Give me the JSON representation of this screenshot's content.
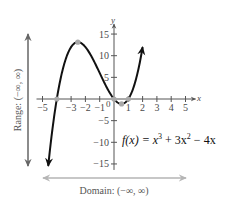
{
  "chart_data": {
    "type": "line",
    "title": "",
    "function_label": "f(x) = x³ + 3x² − 4x",
    "function_parts": {
      "lhs": "f(x) = x",
      "p1": "3",
      "mid": " + 3x",
      "p2": "2",
      "rhs": " − 4x"
    },
    "xlabel": "x",
    "ylabel": "y",
    "xlim": [
      -5,
      5
    ],
    "ylim": [
      -15,
      15
    ],
    "x_ticks": [
      -5,
      -4,
      -3,
      -2,
      -1,
      1,
      2,
      3,
      4,
      5
    ],
    "x_tick_labels": [
      {
        "v": -5,
        "t": "−5"
      },
      {
        "v": -3,
        "t": "−3"
      },
      {
        "v": -2,
        "t": "−2"
      },
      {
        "v": -1,
        "t": "−1"
      },
      {
        "v": 1,
        "t": "1"
      },
      {
        "v": 2,
        "t": "2"
      },
      {
        "v": 3,
        "t": "3"
      },
      {
        "v": 4,
        "t": "4"
      },
      {
        "v": 5,
        "t": "5"
      }
    ],
    "y_ticks": [
      -15,
      -10,
      -5,
      5,
      10,
      15
    ],
    "y_tick_labels": [
      {
        "v": 15,
        "t": "15"
      },
      {
        "v": 10,
        "t": "10"
      },
      {
        "v": 5,
        "t": "5"
      },
      {
        "v": -5,
        "t": "−5"
      },
      {
        "v": -10,
        "t": "−10"
      },
      {
        "v": -15,
        "t": "−15"
      }
    ],
    "origin_label": "0",
    "grid": false,
    "series": [
      {
        "name": "f(x) = x^3 + 3x^2 - 4x",
        "domain_drawn": [
          -4.6,
          2.0
        ],
        "color": "#111111"
      }
    ],
    "marked_points": [
      {
        "label": "x-intercept",
        "x": -4,
        "y": 0
      },
      {
        "label": "local maximum",
        "x": -2.53,
        "y": 13.13
      },
      {
        "label": "x-intercept",
        "x": 0,
        "y": 0
      },
      {
        "label": "local minimum",
        "x": 0.53,
        "y": -1.13
      },
      {
        "label": "x-intercept",
        "x": 1,
        "y": 0
      }
    ],
    "annotations": {
      "range": "Range: (−∞, ∞)",
      "domain": "Domain: (−∞, ∞)"
    },
    "colors": {
      "curve": "#111111",
      "axis": "#555555",
      "marker": "#a8a8a8",
      "range_arrow": "#666666",
      "domain_arrow": "#b5b5b5"
    }
  }
}
